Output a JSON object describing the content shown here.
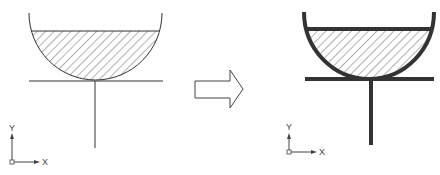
{
  "diagram": {
    "before": {
      "axis_labels": {
        "x": "X",
        "y": "Y"
      },
      "line_weight": "thin"
    },
    "transition_arrow": {
      "direction": "right",
      "style": "outline"
    },
    "after": {
      "axis_labels": {
        "x": "X",
        "y": "Y"
      },
      "line_weight": "thick"
    },
    "colors": {
      "stroke": "#333333",
      "hatch": "#555555",
      "background": "#ffffff"
    }
  }
}
